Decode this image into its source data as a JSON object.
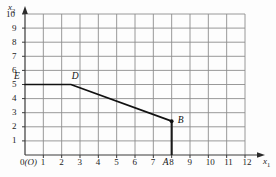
{
  "figure": {
    "axis_x_label": "x",
    "axis_x_sub": "1",
    "axis_y_label": "x",
    "axis_y_sub": "2",
    "origin_label": "0",
    "origin_paren": "(O)",
    "grid_color": "#8d8d8d",
    "line_color": "#111111",
    "background": "#fdfdfd"
  },
  "chart_data": {
    "type": "line",
    "title": "",
    "xlabel": "x1",
    "ylabel": "x2",
    "xlim": [
      0,
      12
    ],
    "ylim": [
      0,
      10
    ],
    "grid": true,
    "legend": "none",
    "xticks": [
      "1",
      "2",
      "3",
      "4",
      "5",
      "6",
      "7",
      "8",
      "9",
      "10",
      "11",
      "12"
    ],
    "xtick_values": [
      1,
      2,
      3,
      4,
      5,
      6,
      7,
      8,
      9,
      10,
      11,
      12
    ],
    "yticks": [
      "1",
      "2",
      "3",
      "4",
      "5",
      "6",
      "7",
      "8",
      "9",
      "10"
    ],
    "ytick_values": [
      1,
      2,
      3,
      4,
      5,
      6,
      7,
      8,
      9,
      10
    ],
    "series": [
      {
        "name": "frontier",
        "x": [
          0,
          2.5,
          8
        ],
        "y": [
          5,
          5,
          2.4
        ]
      }
    ],
    "drop_lines": [
      {
        "name": "B-to-axis",
        "x": 8,
        "y_from": 2.4,
        "y_to": 0
      }
    ],
    "points": [
      {
        "label": "E",
        "x": 0,
        "y": 5
      },
      {
        "label": "D",
        "x": 2.5,
        "y": 5
      },
      {
        "label": "B",
        "x": 8,
        "y": 2.4
      },
      {
        "label": "A",
        "x": 8,
        "y": 0
      }
    ],
    "annotations": [
      {
        "text": "E",
        "x": 0,
        "y": 5
      },
      {
        "text": "D",
        "x": 2.5,
        "y": 5
      },
      {
        "text": "B",
        "x": 8,
        "y": 2.4
      },
      {
        "text": "A",
        "x": 8,
        "y": 0
      }
    ]
  }
}
